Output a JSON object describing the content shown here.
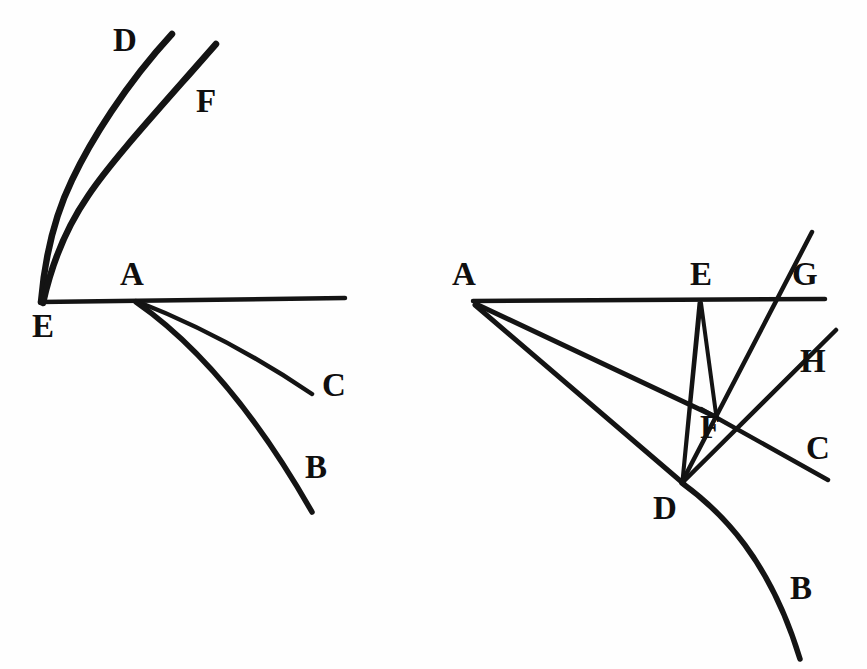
{
  "document": {
    "kind": "engraved-geometric-diagram",
    "background_color": "#fefefe",
    "ink_color": "#141414",
    "width": 867,
    "height": 669
  },
  "figures": [
    {
      "name": "left-figure",
      "labels": [
        {
          "id": "left-label-D",
          "text": "D",
          "x": 113,
          "y": 24
        },
        {
          "id": "left-label-F",
          "text": "F",
          "x": 196,
          "y": 85
        },
        {
          "id": "left-label-A",
          "text": "A",
          "x": 120,
          "y": 258
        },
        {
          "id": "left-label-E",
          "text": "E",
          "x": 32,
          "y": 310
        },
        {
          "id": "left-label-C",
          "text": "C",
          "x": 322,
          "y": 369
        },
        {
          "id": "left-label-B",
          "text": "B",
          "x": 305,
          "y": 451
        }
      ],
      "vertices": {
        "E": {
          "x": 41,
          "y": 302
        },
        "A": {
          "x": 135,
          "y": 302
        }
      }
    },
    {
      "name": "right-figure",
      "labels": [
        {
          "id": "right-label-A",
          "text": "A",
          "x": 452,
          "y": 258
        },
        {
          "id": "right-label-E",
          "text": "E",
          "x": 690,
          "y": 258
        },
        {
          "id": "right-label-G",
          "text": "G",
          "x": 792,
          "y": 258
        },
        {
          "id": "right-label-H",
          "text": "H",
          "x": 800,
          "y": 345
        },
        {
          "id": "right-label-F",
          "text": "F",
          "x": 700,
          "y": 411
        },
        {
          "id": "right-label-C",
          "text": "C",
          "x": 806,
          "y": 432
        },
        {
          "id": "right-label-D",
          "text": "D",
          "x": 653,
          "y": 492
        },
        {
          "id": "right-label-B",
          "text": "B",
          "x": 790,
          "y": 572
        }
      ],
      "vertices": {
        "A": {
          "x": 474,
          "y": 301
        },
        "E": {
          "x": 700,
          "y": 302
        },
        "F": {
          "x": 713,
          "y": 415
        },
        "D": {
          "x": 682,
          "y": 482
        }
      }
    }
  ],
  "chart_data": {
    "type": "line",
    "title": "",
    "xlabel": "",
    "ylabel": "",
    "series": [
      {
        "name": "left-curve-D",
        "figure": "left",
        "kind": "curve",
        "path": "M 41,302 C 45,255 55,215 72,180 C 90,142 125,85 172,34",
        "stroke_width": 6.5,
        "endpoint_label": "D"
      },
      {
        "name": "left-curve-F",
        "figure": "left",
        "kind": "curve",
        "path": "M 43,303 C 52,262 66,228 88,196 C 112,160 160,108 216,44",
        "stroke_width": 6.5,
        "endpoint_label": "F"
      },
      {
        "name": "left-axis-EA",
        "figure": "left",
        "kind": "straight",
        "path": "M 40,302 L 345,298",
        "stroke_width": 4.5,
        "endpoint_label": ""
      },
      {
        "name": "left-ray-C",
        "figure": "left",
        "kind": "curve",
        "path": "M 136,301 C 190,322 250,352 312,394",
        "stroke_width": 4.5,
        "endpoint_label": "C"
      },
      {
        "name": "left-ray-B",
        "figure": "left",
        "kind": "curve",
        "path": "M 136,302 C 188,338 248,400 312,512",
        "stroke_width": 5.5,
        "endpoint_label": "B"
      },
      {
        "name": "right-axis-AG",
        "figure": "right",
        "kind": "straight",
        "path": "M 473,301 L 825,299",
        "stroke_width": 4.5,
        "endpoint_label": ""
      },
      {
        "name": "right-ray-A-to-F",
        "figure": "right",
        "kind": "straight",
        "path": "M 476,304 L 716,417",
        "stroke_width": 5,
        "endpoint_label": "F"
      },
      {
        "name": "right-ray-A-to-D",
        "figure": "right",
        "kind": "straight",
        "path": "M 475,305 L 684,484",
        "stroke_width": 5,
        "endpoint_label": "D"
      },
      {
        "name": "right-wedge-E-to-D-left",
        "figure": "right",
        "kind": "straight",
        "path": "M 699,303 L 682,481",
        "stroke_width": 3,
        "endpoint_label": ""
      },
      {
        "name": "right-wedge-E-to-D-right",
        "figure": "right",
        "kind": "straight",
        "path": "M 701,303 L 683,481",
        "stroke_width": 3,
        "endpoint_label": ""
      },
      {
        "name": "right-wedge-E-to-F",
        "figure": "right",
        "kind": "straight",
        "path": "M 701,303 L 716,414",
        "stroke_width": 4,
        "endpoint_label": ""
      },
      {
        "name": "right-line-G-through-D",
        "figure": "right",
        "kind": "straight",
        "path": "M 812,232 L 682,482",
        "stroke_width": 4.5,
        "endpoint_label": "G"
      },
      {
        "name": "right-line-F-to-H",
        "figure": "right",
        "kind": "straight",
        "path": "M 683,482 L 836,330",
        "stroke_width": 4.5,
        "endpoint_label": "H"
      },
      {
        "name": "right-line-F-to-C",
        "figure": "right",
        "kind": "straight",
        "path": "M 701,409 L 828,480",
        "stroke_width": 4.5,
        "endpoint_label": "C"
      },
      {
        "name": "right-curve-D-to-B",
        "figure": "right",
        "kind": "curve",
        "path": "M 682,483 C 722,512 770,560 800,659",
        "stroke_width": 5.5,
        "endpoint_label": "B"
      }
    ]
  }
}
